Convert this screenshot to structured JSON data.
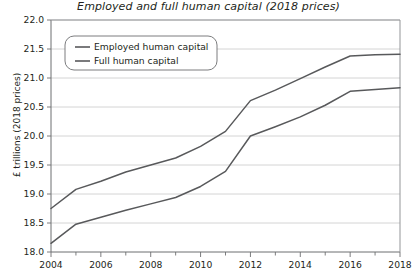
{
  "chart_data": {
    "type": "line",
    "title": "Employed and full human capital (2018 prices)",
    "xlabel": "",
    "ylabel": "£ trillions (2018 prices)",
    "x": [
      2004,
      2005,
      2006,
      2007,
      2008,
      2009,
      2010,
      2011,
      2012,
      2013,
      2014,
      2015,
      2016,
      2017,
      2018
    ],
    "xlim": [
      2004,
      2018
    ],
    "ylim": [
      18.0,
      22.0
    ],
    "x_tick_labels": [
      "2004",
      "2006",
      "2008",
      "2010",
      "2012",
      "2014",
      "2016",
      "2018"
    ],
    "x_ticks": [
      2004,
      2006,
      2008,
      2010,
      2012,
      2014,
      2016,
      2018
    ],
    "x_minor_ticks": [
      2005,
      2007,
      2009,
      2011,
      2013,
      2015,
      2017
    ],
    "y_tick_labels": [
      "18.0",
      "18.5",
      "19.0",
      "19.5",
      "20.0",
      "20.5",
      "21.0",
      "21.5",
      "22.0"
    ],
    "y_ticks": [
      18.0,
      18.5,
      19.0,
      19.5,
      20.0,
      20.5,
      21.0,
      21.5,
      22.0
    ],
    "grid": "horizontal",
    "legend_position": "top-left",
    "series": [
      {
        "name": "Employed human capital",
        "color": "#58595b",
        "values": [
          18.75,
          19.08,
          19.22,
          19.38,
          19.5,
          19.62,
          19.82,
          20.08,
          20.61,
          20.79,
          20.99,
          21.19,
          21.38,
          21.4,
          21.41
        ]
      },
      {
        "name": "Full human capital",
        "color": "#58595b",
        "values": [
          18.15,
          18.48,
          18.6,
          18.72,
          18.83,
          18.94,
          19.13,
          19.39,
          20.0,
          20.16,
          20.33,
          20.53,
          20.77,
          20.8,
          20.83
        ]
      }
    ]
  },
  "legend": {
    "entries": [
      {
        "label": "Employed human capital"
      },
      {
        "label": "Full human capital"
      }
    ]
  },
  "source": {
    "text": ""
  }
}
